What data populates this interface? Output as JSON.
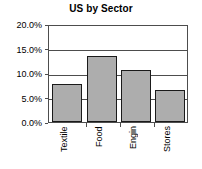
{
  "chart_data": {
    "type": "bar",
    "title": "US by Sector",
    "xlabel": "",
    "ylabel": "",
    "categories": [
      "Textile",
      "Food",
      "Engin",
      "Stores"
    ],
    "values": [
      8.0,
      13.7,
      10.8,
      6.7
    ],
    "value_unit": "%",
    "ylim": [
      0.0,
      20.0
    ],
    "ytick_values": [
      0.0,
      5.0,
      10.0,
      15.0,
      20.0
    ],
    "ytick_labels": [
      "0.0%",
      "5.0%",
      "10.0%",
      "15.0%",
      "20.0%"
    ],
    "grid": true,
    "legend": false,
    "legend_position": "none",
    "bar_fill_color": "#adadad",
    "bar_border_color": "#1a1a1a",
    "axis_color": "#4d4d4d",
    "background_color": "#ffffff"
  }
}
